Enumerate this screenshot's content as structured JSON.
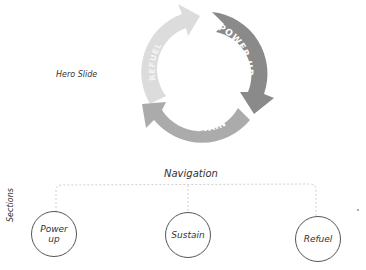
{
  "hero": {
    "label": "Hero Slide",
    "cycle": {
      "segments": [
        {
          "label": "POWER UP",
          "color": "#8a8a8a"
        },
        {
          "label": "SUSTAIN",
          "color": "#ababab"
        },
        {
          "label": "REFUEL",
          "color": "#dcdcdc"
        }
      ]
    }
  },
  "navigation": {
    "label": "Navigation",
    "sections_label": "Sections",
    "nodes": [
      {
        "label": "Power up"
      },
      {
        "label": "Sustain"
      },
      {
        "label": "Refuel"
      }
    ]
  }
}
